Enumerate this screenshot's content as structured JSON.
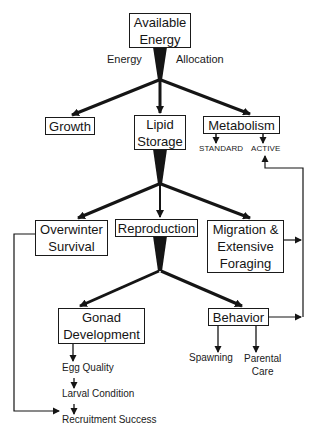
{
  "diagram": {
    "type": "flowchart",
    "nodes": {
      "available_energy": "Available\nEnergy",
      "growth": "Growth",
      "lipid_storage": "Lipid\nStorage",
      "metabolism": "Metabolism",
      "overwinter_survival": "Overwinter\nSurvival",
      "reproduction": "Reproduction",
      "migration": "Migration &\nExtensive\nForaging",
      "gonad_development": "Gonad\nDevelopment",
      "behavior": "Behavior"
    },
    "labels": {
      "energy": "Energy",
      "allocation": "Allocation",
      "standard": "STANDARD",
      "active": "ACTIVE",
      "egg_quality": "Egg Quality",
      "larval_condition": "Larval Condition",
      "recruitment_success": "Recruitment Success",
      "spawning": "Spawning",
      "parental_care": "Parental\nCare"
    },
    "edges": [
      {
        "from": "Available Energy",
        "to": "Growth"
      },
      {
        "from": "Available Energy",
        "to": "Lipid Storage"
      },
      {
        "from": "Available Energy",
        "to": "Metabolism"
      },
      {
        "from": "Metabolism",
        "to": "STANDARD"
      },
      {
        "from": "Metabolism",
        "to": "ACTIVE"
      },
      {
        "from": "Lipid Storage",
        "to": "Overwinter Survival"
      },
      {
        "from": "Lipid Storage",
        "to": "Reproduction"
      },
      {
        "from": "Lipid Storage",
        "to": "Migration & Extensive Foraging"
      },
      {
        "from": "Migration & Extensive Foraging",
        "to": "ACTIVE"
      },
      {
        "from": "Reproduction",
        "to": "Gonad Development"
      },
      {
        "from": "Reproduction",
        "to": "Behavior"
      },
      {
        "from": "Behavior",
        "to": "ACTIVE"
      },
      {
        "from": "Behavior",
        "to": "Spawning"
      },
      {
        "from": "Behavior",
        "to": "Parental Care"
      },
      {
        "from": "Gonad Development",
        "to": "Egg Quality"
      },
      {
        "from": "Egg Quality",
        "to": "Larval Condition"
      },
      {
        "from": "Larval Condition",
        "to": "Recruitment Success"
      },
      {
        "from": "Overwinter Survival",
        "to": "Recruitment Success"
      }
    ],
    "colors": {
      "ink": "#151515",
      "background": "#ffffff"
    }
  }
}
